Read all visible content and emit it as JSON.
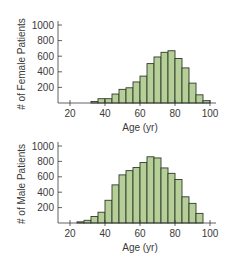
{
  "colors": {
    "bar_fill": "#b6cf98",
    "bar_stroke": "#2e3a2a",
    "axis": "#3a3a3a",
    "text": "#3a3a3a"
  },
  "chart_data": [
    {
      "type": "bar",
      "title": "",
      "xlabel": "Age (yr)",
      "ylabel": "# of Female Patients",
      "xlim": [
        14,
        102
      ],
      "ylim": [
        0,
        1050
      ],
      "xticks": [
        20,
        40,
        60,
        80,
        100
      ],
      "yticks": [
        200,
        400,
        600,
        800,
        1000
      ],
      "grid": false,
      "legend": null,
      "bin_width": 4,
      "bins": [
        [
          32,
          36
        ],
        [
          36,
          40
        ],
        [
          40,
          44
        ],
        [
          44,
          48
        ],
        [
          48,
          52
        ],
        [
          52,
          56
        ],
        [
          56,
          60
        ],
        [
          60,
          64
        ],
        [
          64,
          68
        ],
        [
          68,
          72
        ],
        [
          72,
          76
        ],
        [
          76,
          80
        ],
        [
          80,
          84
        ],
        [
          84,
          88
        ],
        [
          88,
          92
        ],
        [
          92,
          96
        ],
        [
          96,
          100
        ]
      ],
      "values": [
        20,
        55,
        55,
        115,
        175,
        195,
        270,
        345,
        505,
        590,
        650,
        670,
        570,
        450,
        255,
        105,
        30
      ]
    },
    {
      "type": "bar",
      "title": "",
      "xlabel": "Age (yr)",
      "ylabel": "# of Male Patients",
      "xlim": [
        14,
        102
      ],
      "ylim": [
        0,
        1050
      ],
      "xticks": [
        20,
        40,
        60,
        80,
        100
      ],
      "yticks": [
        200,
        400,
        600,
        800,
        1000
      ],
      "grid": false,
      "legend": null,
      "bin_width": 4,
      "bins": [
        [
          24,
          28
        ],
        [
          28,
          32
        ],
        [
          32,
          36
        ],
        [
          36,
          40
        ],
        [
          40,
          44
        ],
        [
          44,
          48
        ],
        [
          48,
          52
        ],
        [
          52,
          56
        ],
        [
          56,
          60
        ],
        [
          60,
          64
        ],
        [
          64,
          68
        ],
        [
          68,
          72
        ],
        [
          72,
          76
        ],
        [
          76,
          80
        ],
        [
          80,
          84
        ],
        [
          84,
          88
        ],
        [
          88,
          92
        ],
        [
          92,
          96
        ]
      ],
      "values": [
        15,
        35,
        85,
        140,
        295,
        495,
        625,
        680,
        720,
        785,
        860,
        845,
        715,
        645,
        565,
        340,
        255,
        125
      ]
    }
  ],
  "panels": [
    {
      "ylabel": "# of Female Patients",
      "xlabel": "Age (yr)"
    },
    {
      "ylabel": "# of Male Patients",
      "xlabel": "Age (yr)"
    }
  ]
}
